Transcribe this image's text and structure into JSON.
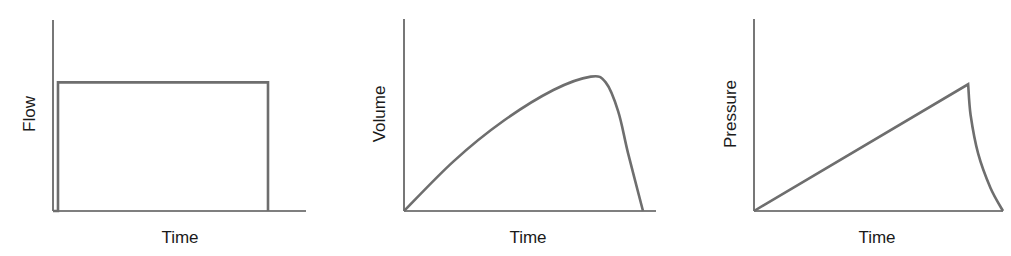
{
  "chart_data": [
    {
      "type": "line",
      "title": "",
      "xlabel": "Time",
      "ylabel": "Flow",
      "grid": false,
      "description": "Constant (square-wave) flow: rises instantly, stays constant, drops instantly to zero",
      "x": [
        0.0,
        0.02,
        0.02,
        0.86,
        0.86
      ],
      "y": [
        0.0,
        0.0,
        0.67,
        0.67,
        0.0
      ],
      "xlim": [
        0,
        1
      ],
      "ylim": [
        0,
        1
      ]
    },
    {
      "type": "line",
      "title": "",
      "xlabel": "Time",
      "ylabel": "Volume",
      "grid": false,
      "description": "Volume rises nearly linearly, peaks, then falls steeply to zero",
      "x": [
        0.0,
        0.2,
        0.4,
        0.6,
        0.75,
        0.81,
        0.86,
        0.9,
        0.96
      ],
      "y": [
        0.0,
        0.26,
        0.47,
        0.63,
        0.7,
        0.67,
        0.52,
        0.3,
        0.0
      ],
      "xlim": [
        0,
        1
      ],
      "ylim": [
        0,
        1
      ]
    },
    {
      "type": "line",
      "title": "",
      "xlabel": "Time",
      "ylabel": "Pressure",
      "grid": false,
      "description": "Pressure rises linearly to a peak, then decays exponentially toward zero",
      "x": [
        0.0,
        0.86,
        0.87,
        0.9,
        0.95,
        1.0
      ],
      "y": [
        0.0,
        0.66,
        0.5,
        0.3,
        0.12,
        0.0
      ],
      "xlim": [
        0,
        1
      ],
      "ylim": [
        0,
        1
      ]
    }
  ],
  "panels": [
    {
      "xlabel": "Time",
      "ylabel": "Flow"
    },
    {
      "xlabel": "Time",
      "ylabel": "Volume"
    },
    {
      "xlabel": "Time",
      "ylabel": "Pressure"
    }
  ]
}
